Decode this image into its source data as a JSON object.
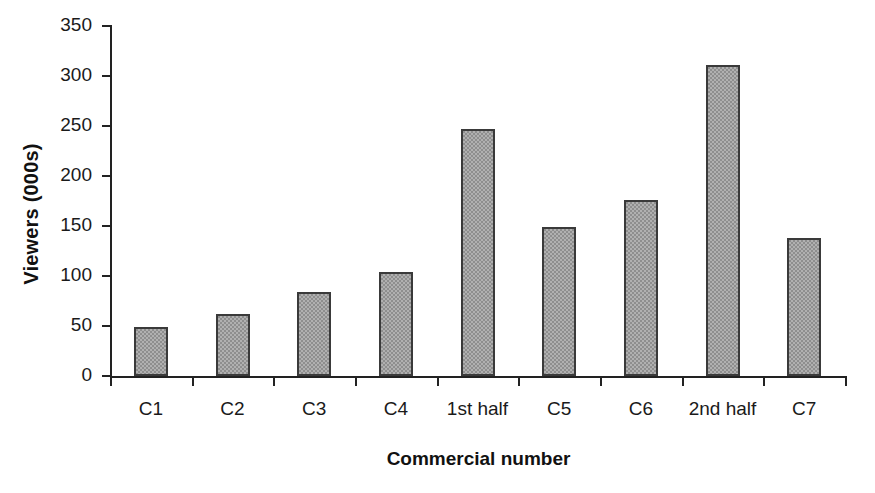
{
  "chart_data": {
    "type": "bar",
    "title": "",
    "xlabel": "Commercial number",
    "ylabel": "Viewers (000s)",
    "categories": [
      "C1",
      "C2",
      "C3",
      "C4",
      "1st half",
      "C5",
      "C6",
      "2nd half",
      "C7"
    ],
    "values": [
      49,
      62,
      84,
      104,
      247,
      149,
      176,
      311,
      138
    ],
    "ylim": [
      0,
      350
    ],
    "yticks": [
      0,
      50,
      100,
      150,
      200,
      250,
      300,
      350
    ],
    "ytick_labels": [
      "0",
      "50",
      "100",
      "150",
      "200",
      "250",
      "300",
      "350"
    ],
    "grid": false,
    "legend": false,
    "bar_color": "#8e8e8e",
    "bar_border_color": "#3a3a3a",
    "axis_color": "#222222",
    "background": "#ffffff"
  },
  "axes": {
    "y_title": "Viewers (000s)",
    "x_title": "Commercial number"
  }
}
